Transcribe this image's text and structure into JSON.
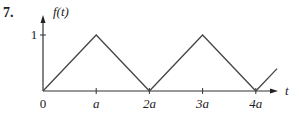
{
  "problem_number": "7.",
  "chart_data": {
    "type": "line",
    "title": "",
    "xlabel": "t",
    "ylabel": "f(t)",
    "x_ticks": [
      {
        "value": 0,
        "label": "0"
      },
      {
        "value": 1,
        "label": "a"
      },
      {
        "value": 2,
        "label": "2a"
      },
      {
        "value": 3,
        "label": "3a"
      },
      {
        "value": 4,
        "label": "4a"
      }
    ],
    "y_ticks": [
      {
        "value": 1,
        "label": "1"
      }
    ],
    "x_units": "a",
    "xlim": [
      0,
      4.4
    ],
    "ylim": [
      0,
      1.2
    ],
    "series": [
      {
        "name": "f(t)",
        "x": [
          0,
          1,
          2,
          3,
          4,
          4.4
        ],
        "y": [
          0,
          1,
          0,
          1,
          0,
          0.4
        ]
      }
    ],
    "grid": false,
    "legend": "none"
  }
}
